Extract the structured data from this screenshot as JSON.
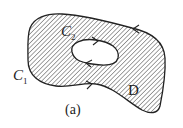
{
  "figure": {
    "caption": "(a)",
    "region_label": "D",
    "outer_curve": {
      "letter": "C",
      "subscript": "1"
    },
    "inner_curve": {
      "letter": "C",
      "subscript": "2"
    },
    "hatch_color": "#555555",
    "stroke_color": "#222222"
  }
}
